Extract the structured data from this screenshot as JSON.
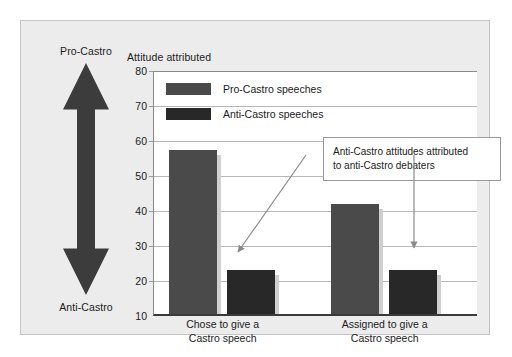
{
  "figure": {
    "title": "Attitude attributed",
    "scale": {
      "top_label": "Pro-Castro",
      "bottom_label": "Anti-Castro",
      "arrow_icon": "double-headed-vertical-arrow-icon"
    },
    "annotation": {
      "line1": "Anti-Castro attitudes attributed",
      "line2": "to anti-Castro debaters"
    }
  },
  "chart_data": {
    "type": "bar",
    "title": "Attitude attributed",
    "xlabel": "",
    "ylabel": "Attitude attributed",
    "ylim": [
      10,
      80
    ],
    "yticks": [
      10,
      20,
      30,
      40,
      50,
      60,
      70,
      80
    ],
    "grid": true,
    "legend_position": "top-left-inside",
    "categories": [
      "Chose to give a Castro speech",
      "Assigned to give a Castro speech"
    ],
    "category_lines": [
      [
        "Chose to give a",
        "Castro speech"
      ],
      [
        "Assigned to give a",
        "Castro speech"
      ]
    ],
    "series": [
      {
        "name": "Pro-Castro speeches",
        "color": "#4a4a4a",
        "values": [
          57,
          41.5
        ]
      },
      {
        "name": "Anti-Castro speeches",
        "color": "#282828",
        "values": [
          22.5,
          22.5
        ]
      }
    ],
    "annotations": [
      {
        "text": "Anti-Castro attitudes attributed to anti-Castro debaters",
        "points_to": [
          "Anti-Castro speeches / Chose to give a Castro speech",
          "Anti-Castro speeches / Assigned to give a Castro speech"
        ]
      }
    ]
  },
  "colors": {
    "panel_background": "#ececec",
    "plot_background": "#ffffff",
    "gridline": "#b8b8b8",
    "axis": "#3a3a3a",
    "pro_castro_bar": "#4a4a4a",
    "anti_castro_bar": "#282828",
    "bar_shadow": "#cfcfcf",
    "text": "#1b1b1b"
  }
}
